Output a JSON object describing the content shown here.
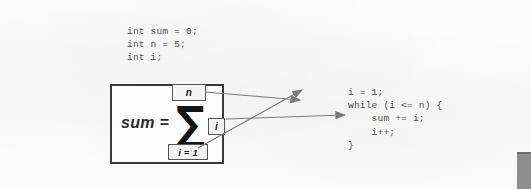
{
  "figure": {
    "declarations_code": "int sum = 0;\nint n = 5;\nint i;",
    "loop_code": "i = 1;\nwhile (i <= n) {\n    sum += i;\n    i++;\n}",
    "formula": {
      "left_label": "sum =",
      "operator": "∑",
      "upper_limit": "n",
      "summand": "i",
      "lower_limit": "i = 1"
    },
    "mappings": [
      {
        "from": "upper-limit",
        "to": "while-condition",
        "source_text": "n",
        "target_text": "while (i <= n) {"
      },
      {
        "from": "lower-limit",
        "to": "initialization",
        "source_text": "i = 1",
        "target_text": "i = 1;"
      },
      {
        "from": "summand",
        "to": "accumulation",
        "source_text": "i",
        "target_text": "sum += i;"
      }
    ],
    "colors": {
      "background": "#fbfbfb",
      "code_text": "#4e4e4e",
      "box_border": "#3a3a3a",
      "arrow": "#7a7a7a",
      "edge_bar": "#8d8d8d"
    }
  }
}
